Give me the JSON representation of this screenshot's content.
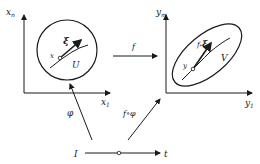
{
  "left_space": {
    "y_axis_label": "x",
    "y_axis_sub": "n",
    "x_axis_label": "x",
    "x_axis_sub": "1",
    "region_label": "U",
    "point_label": "x",
    "vector_label": "ξ"
  },
  "right_space": {
    "y_axis_label": "y",
    "y_axis_sub": "m",
    "x_axis_label": "y",
    "x_axis_sub": "1",
    "region_label": "V",
    "point_label": "y",
    "vector_label": "f",
    "vector_sub": "*",
    "vector_label2": "ξ"
  },
  "arrows": {
    "map_f": "f",
    "map_phi": "φ",
    "map_composite": "f∘φ"
  },
  "interval": {
    "start_label": "I",
    "end_label": "t"
  },
  "colors": {
    "ink": "#1a1a1a",
    "background": "#ffffff"
  }
}
